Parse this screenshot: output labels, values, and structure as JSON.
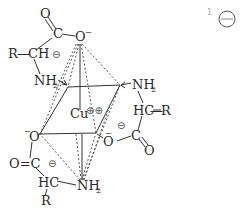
{
  "diagram": {
    "type": "chemical-structure",
    "center_atom": {
      "label": "Cu",
      "charge": "⊕⊕"
    },
    "atoms": {
      "top_carbonyl_O": "O",
      "top_carbonyl_C": "C",
      "top_carboxylate_O": "O",
      "top_carboxylate_O_charge": "−",
      "top_R": "R",
      "top_CH": "CH",
      "top_CH_bond": "—",
      "top_ring_charge": "⊖",
      "top_NH2": "NH",
      "top_NH2_sub": "2",
      "right_NH2": "NH",
      "right_NH2_sub": "2",
      "right_HC": "HC",
      "right_R": "R",
      "right_HC_bond": "—",
      "right_ring_charge": "⊖",
      "right_C": "C",
      "right_O": "O",
      "right_carboxylate_O": "O",
      "right_carboxylate_O_charge": "−",
      "bottom_carboxylate_O": "O",
      "bottom_carboxylate_O_charge": "−",
      "bottom_carbonyl": "O=C",
      "bottom_ring_charge": "⊖",
      "bottom_HC": "HC",
      "bottom_R": "R",
      "bottom_NH2": "NH",
      "bottom_NH2_sub": "2"
    },
    "corner_marker": {
      "number": "1",
      "symbol": "⊖"
    }
  }
}
